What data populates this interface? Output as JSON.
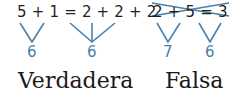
{
  "true_example": {
    "expression": "5 + 1 = 2 + 2 + 2",
    "left_sum": "6",
    "right_sum": "6",
    "label": "Verdadera"
  },
  "false_example": {
    "expression": "2 + 5 = 3 + 3",
    "left_sum": "7",
    "right_sum": "6",
    "label": "Falsa"
  },
  "colors": {
    "text": "#1f1f1f",
    "accent": "#4a7fa8"
  }
}
